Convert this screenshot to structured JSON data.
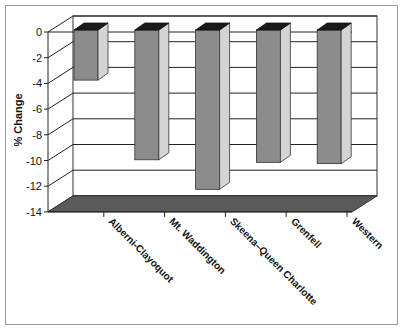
{
  "chart_data": {
    "type": "bar",
    "style": "3d-column",
    "title": "",
    "xlabel": "",
    "ylabel": "% Change",
    "categories": [
      "Alberni-Clayoquot",
      "Mt. Waddington",
      "Skeena–Queen Charlotte",
      "Grenfell",
      "Western"
    ],
    "values": [
      -3.9,
      -10.1,
      -12.4,
      -10.3,
      -10.4
    ],
    "ylim": [
      -14,
      0
    ],
    "yticks": [
      0,
      -2,
      -4,
      -6,
      -8,
      -10,
      -12,
      -14
    ],
    "ytick_labels": [
      "0",
      "-2",
      "-4",
      "-6",
      "-8",
      "-10",
      "-12",
      "-14"
    ],
    "grid": true,
    "legend": null
  },
  "colors": {
    "bar_front": "#8c8c8c",
    "bar_side": "#d4d4d4",
    "bar_top": "#1a1a1a",
    "floor": "#5a5a5a",
    "grid": "#222222",
    "frame": "#9a9a9a"
  }
}
